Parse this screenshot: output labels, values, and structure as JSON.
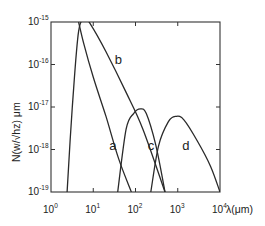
{
  "chart_data": {
    "type": "line",
    "title": "",
    "xlabel": "λ(μm)",
    "ylabel": "N(w/√hz) μm",
    "xscale": "log",
    "yscale": "log",
    "xlim": [
      1,
      10000
    ],
    "ylim": [
      1e-19,
      1e-15
    ],
    "grid": false,
    "legend": "none (curves labeled inline a, b, c, d)",
    "x_ticks": [
      {
        "value": 1,
        "base": "10",
        "exp": "0"
      },
      {
        "value": 10,
        "base": "10",
        "exp": "1"
      },
      {
        "value": 100,
        "base": "10",
        "exp": "2"
      },
      {
        "value": 1000,
        "base": "10",
        "exp": "3"
      },
      {
        "value": 10000,
        "base": "10",
        "exp": "4"
      }
    ],
    "y_ticks": [
      {
        "value": 1e-15,
        "base": "10",
        "exp": "-15"
      },
      {
        "value": 1e-16,
        "base": "10",
        "exp": "-16"
      },
      {
        "value": 1e-17,
        "base": "10",
        "exp": "-17"
      },
      {
        "value": 1e-18,
        "base": "10",
        "exp": "-18"
      },
      {
        "value": 1e-19,
        "base": "10",
        "exp": "-19"
      }
    ],
    "series": [
      {
        "name": "a",
        "label_at": {
          "x": 28,
          "y": 1.2e-18
        },
        "points": [
          [
            4.5,
            1e-15
          ],
          [
            6,
            3e-16
          ],
          [
            10,
            5e-17
          ],
          [
            20,
            6e-18
          ],
          [
            40,
            6e-19
          ],
          [
            80,
            1e-19
          ]
        ]
      },
      {
        "name": "b",
        "label_at": {
          "x": 38,
          "y": 1.3e-16
        },
        "points": [
          [
            2.4,
            1e-19
          ],
          [
            3.2,
            1e-17
          ],
          [
            4.5,
            6e-16
          ],
          [
            6.5,
            1.15e-15
          ],
          [
            8.5,
            9e-16
          ],
          [
            20,
            2e-16
          ],
          [
            60,
            2.2e-17
          ],
          [
            150,
            3e-18
          ],
          [
            500,
            1e-19
          ]
        ]
      },
      {
        "name": "c",
        "label_at": {
          "x": 230,
          "y": 1.2e-18
        },
        "points": [
          [
            38,
            1e-19
          ],
          [
            60,
            3e-18
          ],
          [
            90,
            7e-18
          ],
          [
            130,
            9e-18
          ],
          [
            180,
            7e-18
          ],
          [
            300,
            1.3e-18
          ],
          [
            500,
            1e-19
          ]
        ]
      },
      {
        "name": "d",
        "label_at": {
          "x": 1500,
          "y": 1.2e-18
        },
        "points": [
          [
            230,
            1e-19
          ],
          [
            350,
            1.2e-18
          ],
          [
            600,
            4.5e-18
          ],
          [
            900,
            6e-18
          ],
          [
            1400,
            5e-18
          ],
          [
            3000,
            1.5e-18
          ],
          [
            6000,
            4e-19
          ],
          [
            10000,
            1e-19
          ]
        ]
      }
    ]
  }
}
